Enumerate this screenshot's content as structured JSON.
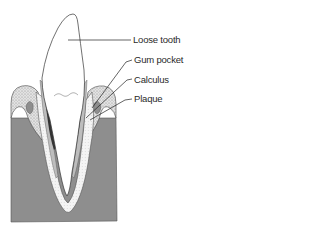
{
  "diagram": {
    "labels": [
      {
        "id": "loose-tooth",
        "text": "Loose tooth",
        "x": 133,
        "y": 34
      },
      {
        "id": "gum-pocket",
        "text": "Gum pocket",
        "x": 134,
        "y": 54
      },
      {
        "id": "calculus",
        "text": "Calculus",
        "x": 134,
        "y": 74
      },
      {
        "id": "plaque",
        "text": "Plaque",
        "x": 134,
        "y": 93
      }
    ],
    "colors": {
      "bone": "#8e8e8e",
      "gum": "#d4d4d4",
      "gum_stipple": "#a8a8a8",
      "tooth": "#ffffff",
      "calculus": "#3a3a3a",
      "plaque": "#bdbdbd",
      "outline": "#333333"
    }
  }
}
